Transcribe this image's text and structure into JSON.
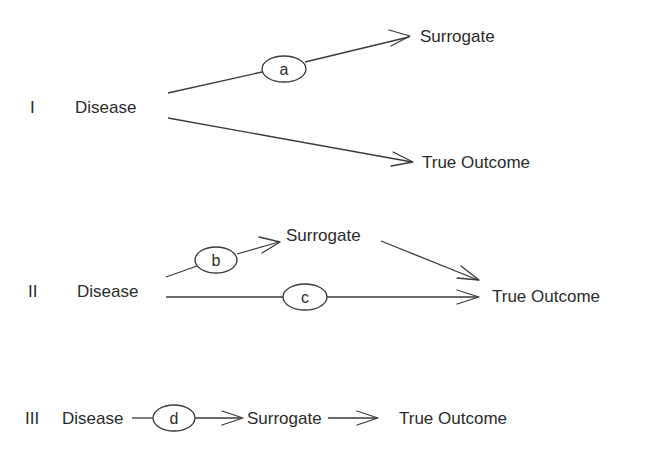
{
  "diagram": {
    "panels": [
      {
        "numeral": "I",
        "source": "Disease",
        "surrogate": "Surrogate",
        "outcome": "True Outcome",
        "edges": [
          {
            "from": "Disease",
            "to": "Surrogate",
            "label": "a"
          },
          {
            "from": "Disease",
            "to": "True Outcome",
            "label": ""
          }
        ]
      },
      {
        "numeral": "II",
        "source": "Disease",
        "surrogate": "Surrogate",
        "outcome": "True Outcome",
        "edges": [
          {
            "from": "Disease",
            "to": "Surrogate",
            "label": "b"
          },
          {
            "from": "Surrogate",
            "to": "True Outcome",
            "label": ""
          },
          {
            "from": "Disease",
            "to": "True Outcome",
            "label": "c"
          }
        ]
      },
      {
        "numeral": "III",
        "source": "Disease",
        "surrogate": "Surrogate",
        "outcome": "True Outcome",
        "edges": [
          {
            "from": "Disease",
            "to": "Surrogate",
            "label": "d"
          },
          {
            "from": "Surrogate",
            "to": "True Outcome",
            "label": ""
          }
        ]
      }
    ],
    "colors": {
      "ink": "#2b2b2b",
      "background": "#ffffff"
    }
  }
}
